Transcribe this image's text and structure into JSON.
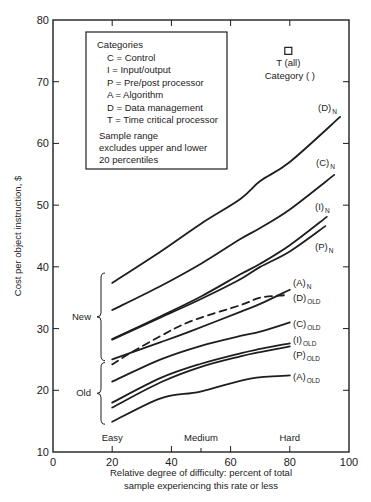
{
  "chart_data": {
    "type": "line",
    "title": "",
    "xlabel": "Relative degree of difficulty:  percent of total sample experiencing this rate or less",
    "xlabel_lines": [
      "Relative degree of difficulty:  percent of total",
      "sample experiencing this rate or less"
    ],
    "ylabel": "Cost per object  instruction, $",
    "xlim": [
      0,
      100
    ],
    "ylim": [
      10,
      80
    ],
    "x_ticks": [
      0,
      20,
      40,
      60,
      80,
      100
    ],
    "x_minor_ticks": [
      50
    ],
    "y_ticks": [
      10,
      20,
      30,
      40,
      50,
      60,
      70,
      80
    ],
    "grid": false,
    "difficulty_labels": [
      {
        "text": "Easy",
        "x": 20
      },
      {
        "text": "Medium",
        "x": 50
      },
      {
        "text": "Hard",
        "x": 80
      }
    ],
    "legend": {
      "title": "Categories",
      "entries": [
        "C = Control",
        "I  = Input/output",
        "P = Pre/post processor",
        "A = Algorithm",
        "D = Data management",
        "T = Time critical processor"
      ],
      "note": [
        "Sample range",
        "excludes upper and lower",
        "20 percentiles"
      ]
    },
    "series": [
      {
        "name": "(D)N",
        "label": "(D)",
        "sub": "N",
        "group": "New",
        "dashed": false,
        "x": [
          20,
          36.4,
          50,
          63.3,
          70,
          80,
          97
        ],
        "y": [
          37.4,
          42.5,
          47,
          51,
          53.9,
          57,
          64.3
        ]
      },
      {
        "name": "(C)N",
        "label": "(C)",
        "sub": "N",
        "group": "New",
        "dashed": false,
        "x": [
          20,
          36.4,
          50,
          63.3,
          70,
          80,
          95
        ],
        "y": [
          33,
          36.9,
          40.5,
          44.5,
          46.3,
          49.3,
          54.9
        ]
      },
      {
        "name": "(I)N",
        "label": "(I)",
        "sub": "N",
        "group": "New",
        "dashed": false,
        "x": [
          20,
          36.4,
          50,
          63.3,
          70,
          80,
          92.5
        ],
        "y": [
          28.3,
          32,
          35.2,
          38.8,
          40.5,
          43.5,
          48.1
        ]
      },
      {
        "name": "(P)N",
        "label": "(P)",
        "sub": "N",
        "group": "New",
        "dashed": false,
        "x": [
          20,
          36.4,
          50,
          63.3,
          70,
          80,
          92
        ],
        "y": [
          28.2,
          31.8,
          34.8,
          38,
          40,
          42.5,
          46.6
        ]
      },
      {
        "name": "(A)N",
        "label": "(A)",
        "sub": "N",
        "group": "New",
        "dashed": false,
        "x": [
          20,
          36.4,
          46.6,
          63.3,
          70,
          80
        ],
        "y": [
          25,
          27.8,
          29.6,
          32.7,
          34,
          36.3
        ]
      },
      {
        "name": "(D)OLD",
        "label": "(D)",
        "sub": "OLD",
        "group": "Old",
        "dashed": true,
        "x": [
          20,
          26,
          36.4,
          46.6,
          63.3,
          70,
          78
        ],
        "y": [
          24.2,
          26,
          28.8,
          31.2,
          33.8,
          35,
          35.4
        ]
      },
      {
        "name": "(C)OLD",
        "label": "(C)",
        "sub": "OLD",
        "group": "Old",
        "dashed": false,
        "x": [
          20,
          36.4,
          50,
          63.3,
          70,
          80
        ],
        "y": [
          21.4,
          25,
          27.2,
          28.8,
          29.5,
          31
        ]
      },
      {
        "name": "(I)OLD",
        "label": "(I)",
        "sub": "OLD",
        "group": "Old",
        "dashed": false,
        "x": [
          20,
          36.4,
          50,
          63.3,
          70,
          80
        ],
        "y": [
          18,
          22,
          24.3,
          26,
          26.7,
          27.6
        ]
      },
      {
        "name": "(P)OLD",
        "label": "(P)",
        "sub": "OLD",
        "group": "Old",
        "dashed": false,
        "x": [
          20,
          36.4,
          50,
          63.3,
          70,
          80
        ],
        "y": [
          17.2,
          21.3,
          23.8,
          25.5,
          26.2,
          27.1
        ]
      },
      {
        "name": "(A)OLD",
        "label": "(A)",
        "sub": "OLD",
        "group": "Old",
        "dashed": false,
        "x": [
          20,
          36.4,
          49.8,
          66.7,
          80
        ],
        "y": [
          14.9,
          18.7,
          19.8,
          21.9,
          22.4
        ]
      }
    ],
    "points": [
      {
        "name": "T (all)",
        "x": 79.5,
        "y": 75,
        "marker": "square"
      }
    ],
    "annotations": [
      {
        "text": "Category (  )",
        "x": 80,
        "y": 70.5
      },
      {
        "text": "New",
        "brace_from": 24.8,
        "brace_to": 39
      },
      {
        "text": "Old",
        "brace_from": 14.5,
        "brace_to": 24.5
      }
    ]
  }
}
